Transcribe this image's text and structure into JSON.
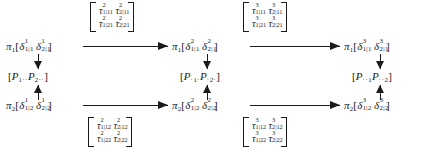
{
  "diagram": {
    "type": "commutative-diagram",
    "columns": 3,
    "rows": 2
  },
  "nodes": {
    "row1": [
      {
        "id": "pi1-delta1",
        "pi": "π",
        "pi_sub": "1",
        "open": "[",
        "close": "]",
        "terms": [
          {
            "symbol": "δ",
            "sup": "1",
            "sub": "1|1"
          },
          {
            "symbol": "δ",
            "sup": "1",
            "sub": "2|1"
          }
        ],
        "text": "π₁[δ¹₁|₁ δ¹₂|₁]"
      },
      {
        "id": "pi1-delta2",
        "pi": "π",
        "pi_sub": "1",
        "open": "[",
        "close": "]",
        "terms": [
          {
            "symbol": "δ",
            "sup": "2",
            "sub": "1|1"
          },
          {
            "symbol": "δ",
            "sup": "2",
            "sub": "2|1"
          }
        ],
        "text": "π₁[δ²₁|₁ δ²₂|₁]"
      },
      {
        "id": "pi1-delta3",
        "pi": "π",
        "pi_sub": "1",
        "open": "[",
        "close": "]",
        "terms": [
          {
            "symbol": "δ",
            "sup": "3",
            "sub": "1|1"
          },
          {
            "symbol": "δ",
            "sup": "3",
            "sub": "2|1"
          }
        ],
        "text": "π₁[δ³₁|₁ δ³₂|₁]"
      }
    ],
    "row2": [
      {
        "id": "pi2-delta1",
        "pi": "π",
        "pi_sub": "2",
        "open": "[",
        "close": "]",
        "terms": [
          {
            "symbol": "δ",
            "sup": "1",
            "sub": "1|2"
          },
          {
            "symbol": "δ",
            "sup": "1",
            "sub": "2|2"
          }
        ],
        "text": "π₂[δ¹₁|₂ δ¹₂|₂]"
      },
      {
        "id": "pi2-delta2",
        "pi": "π",
        "pi_sub": "2",
        "open": "[",
        "close": "]",
        "terms": [
          {
            "symbol": "δ",
            "sup": "2",
            "sub": "1|2"
          },
          {
            "symbol": "δ",
            "sup": "2",
            "sub": "2|2"
          }
        ],
        "text": "π₂[δ²₁|₂ δ²₂|₂]"
      },
      {
        "id": "pi2-delta3",
        "pi": "π",
        "pi_sub": "2",
        "open": "[",
        "close": "]",
        "terms": [
          {
            "symbol": "δ",
            "sup": "3",
            "sub": "1|2"
          },
          {
            "symbol": "δ",
            "sup": "3",
            "sub": "2|2"
          }
        ],
        "text": "π₂[δ³₁|₂ δ³₂|₂]"
      }
    ]
  },
  "p_brackets": [
    {
      "id": "p-col1",
      "open": "[",
      "close": "]",
      "terms": [
        {
          "symbol": "P",
          "sub": "1··"
        },
        {
          "symbol": "P",
          "sub": "2··"
        }
      ],
      "text": "[P₁·· P₂··]"
    },
    {
      "id": "p-col2",
      "open": "[",
      "close": "]",
      "terms": [
        {
          "symbol": "P",
          "sub": "·1·"
        },
        {
          "symbol": "P",
          "sub": "·2·"
        }
      ],
      "text": "[P·₁· P·₂·]"
    },
    {
      "id": "p-col3",
      "open": "[",
      "close": "]",
      "terms": [
        {
          "symbol": "P",
          "sub": "··1"
        },
        {
          "symbol": "P",
          "sub": "··2"
        }
      ],
      "text": "[P··₁ P··₂]"
    }
  ],
  "matrices": [
    {
      "id": "tau-top-left",
      "position": "above-row1-between-col1-col2",
      "symbol": "τ",
      "rows": [
        [
          {
            "symbol": "τ",
            "sup": "2",
            "sub": "1|11"
          },
          {
            "symbol": "τ",
            "sup": "2",
            "sub": "2|11"
          }
        ],
        [
          {
            "symbol": "τ",
            "sup": "2",
            "sub": "1|21"
          },
          {
            "symbol": "τ",
            "sup": "2",
            "sub": "2|21"
          }
        ]
      ],
      "text": "[[τ²₁|₁₁ τ²₂|₁₁],[τ²₁|₂₁ τ²₂|₂₁]]"
    },
    {
      "id": "tau-top-right",
      "position": "above-row1-between-col2-col3",
      "symbol": "τ",
      "rows": [
        [
          {
            "symbol": "τ",
            "sup": "3",
            "sub": "1|11"
          },
          {
            "symbol": "τ",
            "sup": "3",
            "sub": "2|11"
          }
        ],
        [
          {
            "symbol": "τ",
            "sup": "3",
            "sub": "1|21"
          },
          {
            "symbol": "τ",
            "sup": "3",
            "sub": "2|21"
          }
        ]
      ],
      "text": "[[τ³₁|₁₁ τ³₂|₁₁],[τ³₁|₂₁ τ³₂|₂₁]]"
    },
    {
      "id": "tau-bottom-left",
      "position": "below-row2-between-col1-col2",
      "symbol": "τ",
      "rows": [
        [
          {
            "symbol": "τ",
            "sup": "2",
            "sub": "1|12"
          },
          {
            "symbol": "τ",
            "sup": "2",
            "sub": "2|12"
          }
        ],
        [
          {
            "symbol": "τ",
            "sup": "2",
            "sub": "1|22"
          },
          {
            "symbol": "τ",
            "sup": "2",
            "sub": "2|22"
          }
        ]
      ],
      "text": "[[τ²₁|₁₂ τ²₂|₁₂],[τ²₁|₂₂ τ²₂|₂₂]]"
    },
    {
      "id": "tau-bottom-right",
      "position": "below-row2-between-col2-col3",
      "symbol": "τ",
      "rows": [
        [
          {
            "symbol": "τ",
            "sup": "3",
            "sub": "1|12"
          },
          {
            "symbol": "τ",
            "sup": "3",
            "sub": "2|12"
          }
        ],
        [
          {
            "symbol": "τ",
            "sup": "3",
            "sub": "1|22"
          },
          {
            "symbol": "τ",
            "sup": "3",
            "sub": "2|22"
          }
        ]
      ],
      "text": "[[τ³₁|₁₂ τ³₂|₁₂],[τ³₁|₂₂ τ³₂|₂₂]]"
    }
  ],
  "arrows": {
    "horizontal": [
      {
        "id": "arrow-row1-col1-col2",
        "direction": "right"
      },
      {
        "id": "arrow-row1-col2-col3",
        "direction": "right"
      },
      {
        "id": "arrow-row2-col1-col2",
        "direction": "right"
      },
      {
        "id": "arrow-row2-col2-col3",
        "direction": "right"
      }
    ],
    "vertical": [
      {
        "id": "arrow-col1-down",
        "direction": "down"
      },
      {
        "id": "arrow-col1-up",
        "direction": "up"
      },
      {
        "id": "arrow-col2-down",
        "direction": "down"
      },
      {
        "id": "arrow-col2-up",
        "direction": "up"
      },
      {
        "id": "arrow-col3-down",
        "direction": "down"
      },
      {
        "id": "arrow-col3-up",
        "direction": "up"
      }
    ]
  },
  "colors": {
    "ink": "#1a1a1a",
    "background": "#ffffff"
  }
}
